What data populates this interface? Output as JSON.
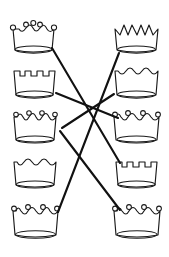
{
  "worksheet": {
    "title": "Crown Matching Worksheet",
    "background_color": "#ffffff",
    "ink_color": "#1a1a1a",
    "line_color": "#111111",
    "width": 169,
    "height": 257,
    "description": "Matching exercise: five crowns in a left column and five crowns in a right column, joined by drawn straight lines that cross in the middle."
  },
  "left_column": {
    "label": "Left crown column",
    "crowns": [
      {
        "id": "left-1",
        "index": 1,
        "style": "rounded-bumps-with-ball-tips",
        "points": 3,
        "tip_balls": true,
        "cx": 33,
        "cy": 37,
        "width": 46,
        "height": 34
      },
      {
        "id": "left-2",
        "index": 2,
        "style": "square-battlements",
        "points": 4,
        "tip_balls": false,
        "cx": 34,
        "cy": 82,
        "width": 46,
        "height": 33
      },
      {
        "id": "left-3",
        "index": 3,
        "style": "wavy-scallops-with-ball-tips",
        "points": 4,
        "tip_balls": true,
        "cx": 35,
        "cy": 127,
        "width": 46,
        "height": 33
      },
      {
        "id": "left-4",
        "index": 4,
        "style": "rounded-arches",
        "points": 3,
        "tip_balls": false,
        "cx": 35,
        "cy": 172,
        "width": 46,
        "height": 33
      },
      {
        "id": "left-5",
        "index": 5,
        "style": "rounded-bumps-with-ball-tips",
        "points": 4,
        "tip_balls": true,
        "cx": 36,
        "cy": 220,
        "width": 48,
        "height": 35
      }
    ]
  },
  "right_column": {
    "label": "Right crown column",
    "crowns": [
      {
        "id": "right-1",
        "index": 1,
        "style": "pointed-spikes",
        "points": 5,
        "tip_balls": false,
        "cx": 136,
        "cy": 37,
        "width": 46,
        "height": 34
      },
      {
        "id": "right-2",
        "index": 2,
        "style": "rounded-arches",
        "points": 4,
        "tip_balls": false,
        "cx": 136,
        "cy": 82,
        "width": 46,
        "height": 33
      },
      {
        "id": "right-3",
        "index": 3,
        "style": "rounded-bumps-with-ball-tips",
        "points": 4,
        "tip_balls": true,
        "cx": 136,
        "cy": 127,
        "width": 47,
        "height": 34
      },
      {
        "id": "right-4",
        "index": 4,
        "style": "square-battlements",
        "points": 4,
        "tip_balls": false,
        "cx": 136,
        "cy": 172,
        "width": 46,
        "height": 33
      },
      {
        "id": "right-5",
        "index": 5,
        "style": "rounded-bumps-with-ball-tips",
        "points": 4,
        "tip_balls": true,
        "cx": 137,
        "cy": 220,
        "width": 47,
        "height": 35
      }
    ]
  },
  "connections": [
    {
      "id": "line-1",
      "from": "left-1",
      "to": "right-4",
      "x1": 52,
      "y1": 48,
      "x2": 120,
      "y2": 163
    },
    {
      "id": "line-2",
      "from": "left-2",
      "to": "right-3",
      "x1": 56,
      "y1": 93,
      "x2": 118,
      "y2": 118
    },
    {
      "id": "line-3",
      "from": "left-3",
      "to": "right-5",
      "x1": 60,
      "y1": 131,
      "x2": 120,
      "y2": 210
    },
    {
      "id": "line-4",
      "from": "left-5",
      "to": "right-1",
      "x1": 58,
      "y1": 212,
      "x2": 119,
      "y2": 53
    },
    {
      "id": "line-5",
      "from": "left-3",
      "to": "right-2",
      "x1": 62,
      "y1": 128,
      "x2": 114,
      "y2": 94
    }
  ]
}
